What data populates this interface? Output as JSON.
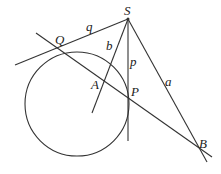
{
  "diagram": {
    "title": "",
    "colors": {
      "line": "#333333",
      "label": "#222222",
      "background": "#ffffff"
    },
    "points": {
      "S": {
        "label": "S",
        "x": 128,
        "y": 19
      },
      "Q": {
        "label": "Q",
        "x": 59,
        "y": 47
      },
      "P": {
        "label": "P",
        "x": 128,
        "y": 98
      },
      "A": {
        "label": "A",
        "x": 102,
        "y": 84
      },
      "B": {
        "label": "B",
        "x": 198,
        "y": 148
      }
    },
    "circle": {
      "cx": 77,
      "cy": 104,
      "r": 52
    },
    "segment_labels": {
      "q": "q",
      "b": "b",
      "p": "p",
      "a": "a"
    },
    "labels": {
      "S": "S",
      "Q": "Q",
      "P": "P",
      "A": "A",
      "B": "B"
    }
  }
}
